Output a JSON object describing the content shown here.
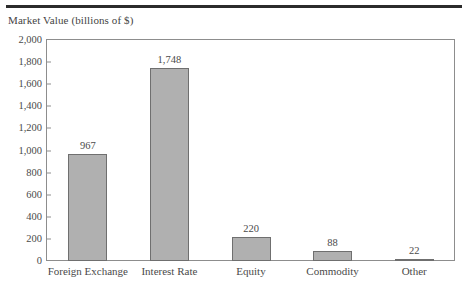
{
  "chart_data": {
    "type": "bar",
    "title": "",
    "ylabel": "Market Value (billions of $)",
    "xlabel": "",
    "categories": [
      "Foreign Exchange",
      "Interest Rate",
      "Equity",
      "Commodity",
      "Other"
    ],
    "values": [
      967,
      1748,
      220,
      88,
      22
    ],
    "value_labels": [
      "967",
      "1,748",
      "220",
      "88",
      "22"
    ],
    "ylim": [
      0,
      2000
    ],
    "ytick_values": [
      0,
      200,
      400,
      600,
      800,
      1000,
      1200,
      1400,
      1600,
      1800,
      2000
    ],
    "ytick_labels": [
      "0",
      "200",
      "400",
      "600",
      "800",
      "1,000",
      "1,200",
      "1,400",
      "1,600",
      "1,800",
      "2,000"
    ],
    "grid": false,
    "legend": "none",
    "bar_fill_color": "#b0b0b0",
    "bar_border_color": "#6f6f6f",
    "axis_color": "#8d8d8d",
    "text_color": "#4a4a4a",
    "top_rule_color": "#2b2b2b",
    "background_color": "#ffffff"
  }
}
